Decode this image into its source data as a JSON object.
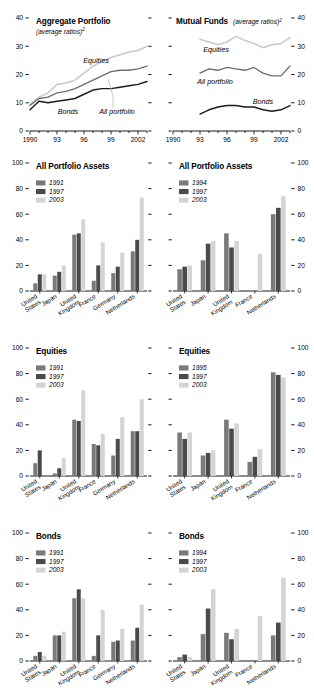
{
  "colors": {
    "series_1991": "#7a7a7a",
    "series_1997": "#4a4a4a",
    "series_2003": "#d4d4d4",
    "line_equities": "#c9c9c9",
    "line_all": "#6e6e6e",
    "line_bonds": "#1a1a1a",
    "axis": "#000000"
  },
  "panels": {
    "aggregate": {
      "title": "Aggregate Portfolio",
      "subtitle": "(average ratios)",
      "subtitle_sup": "2",
      "labels": {
        "equities": "Equities",
        "bonds": "Bonds",
        "all": "All portfolio"
      }
    },
    "mutual": {
      "title": "Mutual Funds",
      "subtitle": "(average ratios)",
      "subtitle_sup": "2",
      "labels": {
        "equities": "Equities",
        "bonds": "Bonds",
        "all": "All portfolio"
      }
    },
    "apa_left": {
      "title": "All Portfolio Assets"
    },
    "apa_right": {
      "title": "All Portfolio Assets"
    },
    "eq_left": {
      "title": "Equities"
    },
    "eq_right": {
      "title": "Equities"
    },
    "bd_left": {
      "title": "Bonds"
    },
    "bd_right": {
      "title": "Bonds"
    }
  },
  "chart_data": [
    {
      "id": "aggregate-portfolio",
      "type": "line",
      "title": "Aggregate Portfolio",
      "subtitle": "(average ratios)2",
      "xlabel": "",
      "ylabel": "",
      "ylim": [
        0,
        40
      ],
      "yticks": [
        0,
        10,
        20,
        30,
        40
      ],
      "xlim": [
        1990,
        2003
      ],
      "xticks": [
        1990,
        1993,
        1996,
        1999,
        2002
      ],
      "xtick_labels": [
        "1990",
        "93",
        "96",
        "99",
        "2002"
      ],
      "x": [
        1990,
        1991,
        1992,
        1993,
        1994,
        1995,
        1996,
        1997,
        1998,
        1999,
        2000,
        2001,
        2002,
        2003
      ],
      "series": [
        {
          "name": "Equities",
          "values": [
            9.5,
            12.0,
            13.5,
            16.5,
            17.0,
            18.0,
            20.5,
            23.0,
            24.5,
            26.0,
            27.0,
            28.0,
            28.5,
            30.0
          ]
        },
        {
          "name": "All portfolio",
          "values": [
            9.0,
            11.5,
            12.0,
            13.5,
            14.0,
            15.0,
            16.5,
            18.0,
            19.5,
            21.0,
            21.5,
            21.5,
            22.0,
            23.0
          ]
        },
        {
          "name": "Bonds",
          "values": [
            7.5,
            10.5,
            10.0,
            10.5,
            11.0,
            11.5,
            13.0,
            14.5,
            15.0,
            15.0,
            15.5,
            16.0,
            16.5,
            17.5
          ]
        }
      ],
      "grid": false,
      "legend": "inline-annotations"
    },
    {
      "id": "mutual-funds",
      "type": "line",
      "title": "Mutual Funds",
      "subtitle": "(average ratios)2",
      "xlabel": "",
      "ylabel": "",
      "ylim": [
        0,
        40
      ],
      "yticks": [
        0,
        10,
        20,
        30,
        40
      ],
      "xlim": [
        1990,
        2003
      ],
      "xticks": [
        1990,
        1993,
        1996,
        1999,
        2002
      ],
      "xtick_labels": [
        "1990",
        "93",
        "96",
        "99",
        "2002"
      ],
      "x": [
        1993,
        1994,
        1995,
        1996,
        1997,
        1998,
        1999,
        2000,
        2001,
        2002,
        2003
      ],
      "series": [
        {
          "name": "Equities",
          "values": [
            32.5,
            31.5,
            30.5,
            31.5,
            33.5,
            32.0,
            31.0,
            29.5,
            30.5,
            31.0,
            33.0
          ]
        },
        {
          "name": "All portfolio",
          "values": [
            20.5,
            22.0,
            21.5,
            22.5,
            22.0,
            21.5,
            22.5,
            20.5,
            19.5,
            19.5,
            23.0
          ]
        },
        {
          "name": "Bonds",
          "values": [
            6.0,
            7.5,
            8.5,
            9.0,
            9.0,
            8.5,
            8.5,
            7.5,
            7.0,
            7.5,
            9.0
          ]
        }
      ],
      "grid": false,
      "legend": "inline-annotations"
    },
    {
      "id": "all-portfolio-assets-left",
      "type": "bar",
      "title": "All Portfolio Assets",
      "categories": [
        "United States",
        "Japan",
        "United Kingdom",
        "France",
        "Germany",
        "Netherlands"
      ],
      "ylim": [
        0,
        100
      ],
      "yticks": [
        0,
        20,
        40,
        60,
        80,
        100
      ],
      "series": [
        {
          "name": "1991",
          "values": [
            6,
            12,
            44,
            8,
            14,
            31
          ]
        },
        {
          "name": "1997",
          "values": [
            13,
            15,
            45,
            20,
            19,
            40
          ]
        },
        {
          "name": "2003",
          "values": [
            13,
            20,
            56,
            38,
            30,
            73
          ]
        }
      ]
    },
    {
      "id": "all-portfolio-assets-right",
      "type": "bar",
      "title": "All Portfolio Assets",
      "categories": [
        "United States",
        "Japan",
        "United Kingdom",
        "France",
        "Netherlands"
      ],
      "ylim": [
        0,
        100
      ],
      "yticks": [
        0,
        20,
        40,
        60,
        80,
        100
      ],
      "series": [
        {
          "name": "1994",
          "values": [
            17,
            24,
            45,
            0,
            60
          ]
        },
        {
          "name": "1997",
          "values": [
            19,
            37,
            34,
            0,
            65
          ]
        },
        {
          "name": "2003",
          "values": [
            20,
            39,
            39,
            29,
            74
          ]
        }
      ]
    },
    {
      "id": "equities-left",
      "type": "bar",
      "title": "Equities",
      "categories": [
        "United States",
        "Japan",
        "United Kingdom",
        "France",
        "Germany",
        "Netherlands"
      ],
      "ylim": [
        0,
        100
      ],
      "yticks": [
        0,
        20,
        40,
        60,
        80,
        100
      ],
      "series": [
        {
          "name": "1991",
          "values": [
            10,
            2,
            44,
            25,
            16,
            35
          ]
        },
        {
          "name": "1997",
          "values": [
            20,
            6,
            43,
            24,
            29,
            35
          ]
        },
        {
          "name": "2003",
          "values": [
            0,
            14,
            67,
            33,
            46,
            60
          ]
        }
      ]
    },
    {
      "id": "equities-right",
      "type": "bar",
      "title": "Equities",
      "categories": [
        "United States",
        "Japan",
        "United Kingdom",
        "France",
        "Netherlands"
      ],
      "ylim": [
        0,
        100
      ],
      "yticks": [
        0,
        20,
        40,
        60,
        80,
        100
      ],
      "series": [
        {
          "name": "1995",
          "values": [
            34,
            16,
            44,
            11,
            81
          ]
        },
        {
          "name": "1997",
          "values": [
            29,
            18,
            37,
            15,
            79
          ]
        },
        {
          "name": "2003",
          "values": [
            34,
            20,
            41,
            21,
            77
          ]
        }
      ]
    },
    {
      "id": "bonds-left",
      "type": "bar",
      "title": "Bonds",
      "categories": [
        "United States",
        "Japan",
        "United Kingdom",
        "France",
        "Germany",
        "Netherlands"
      ],
      "ylim": [
        0,
        100
      ],
      "yticks": [
        0,
        20,
        40,
        60,
        80,
        100
      ],
      "series": [
        {
          "name": "1991",
          "values": [
            4,
            20,
            49,
            4,
            15,
            16
          ]
        },
        {
          "name": "1997",
          "values": [
            7,
            20,
            56,
            20,
            16,
            26
          ]
        },
        {
          "name": "2003",
          "values": [
            4,
            23,
            49,
            40,
            25,
            44
          ]
        }
      ]
    },
    {
      "id": "bonds-right",
      "type": "bar",
      "title": "Bonds",
      "categories": [
        "United States",
        "Japan",
        "United Kingdom",
        "France",
        "Netherlands"
      ],
      "ylim": [
        0,
        100
      ],
      "yticks": [
        0,
        20,
        40,
        60,
        80,
        100
      ],
      "series": [
        {
          "name": "1994",
          "values": [
            3,
            21,
            22,
            0,
            20
          ]
        },
        {
          "name": "1997",
          "values": [
            5,
            41,
            17,
            0,
            30
          ]
        },
        {
          "name": "2003",
          "values": [
            3,
            56,
            25,
            35,
            65
          ]
        }
      ]
    }
  ]
}
